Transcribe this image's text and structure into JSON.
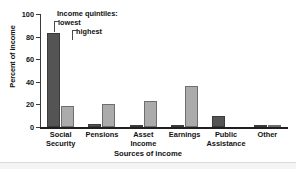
{
  "chart_data": {
    "type": "bar",
    "title": "",
    "xlabel": "Sources of income",
    "ylabel": "Percent of income",
    "categories": [
      "Social\nSecurity",
      "Pensions",
      "Asset\nIncome",
      "Earnings",
      "Public\nAssistance",
      "Other"
    ],
    "series": [
      {
        "name": "lowest",
        "values": [
          83,
          3,
          2,
          1,
          10,
          2
        ]
      },
      {
        "name": "highest",
        "values": [
          19,
          20,
          23,
          36,
          0,
          2
        ]
      }
    ],
    "ylim": [
      0,
      100
    ],
    "yticks": [
      0,
      20,
      40,
      60,
      80,
      100
    ],
    "ytick_labels": [
      "0",
      "20",
      "40",
      "60",
      "80",
      "100"
    ],
    "grid": false,
    "legend_position": "inside-top-left",
    "legend_title": "Income quintiles:",
    "colors": {
      "lowest": "#545454",
      "highest": "#ababab",
      "axis": "#1f1f1f",
      "text": "#111111"
    }
  },
  "legend": {
    "title": "Income quintiles:",
    "lowest_label": "lowest",
    "highest_label": "highest"
  },
  "axes": {
    "y_title": "Percent of income",
    "x_title": "Sources of income"
  }
}
